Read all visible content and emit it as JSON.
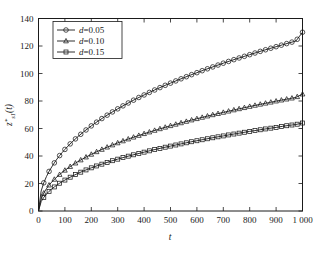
{
  "chart_data": {
    "type": "line",
    "title": "",
    "subtitle": "",
    "xlabel": "t",
    "ylabel": "z*s1(t)",
    "ylabel_parts": {
      "base": "z",
      "sup": "*",
      "sub": "s1",
      "arg": "(t)"
    },
    "xlim": [
      0,
      1000
    ],
    "ylim": [
      0,
      140
    ],
    "xticks": [
      0,
      100,
      200,
      300,
      400,
      500,
      600,
      700,
      800,
      900,
      1000
    ],
    "xtick_labels": [
      "0",
      "100",
      "200",
      "300",
      "400",
      "500",
      "600",
      "700",
      "800",
      "900",
      "1 000"
    ],
    "yticks": [
      0,
      20,
      40,
      60,
      80,
      100,
      120,
      140
    ],
    "ytick_labels": [
      "0",
      "20",
      "40",
      "60",
      "80",
      "100",
      "120",
      "140"
    ],
    "grid": false,
    "legend_position": "upper left",
    "x": [
      0,
      10,
      20,
      30,
      40,
      50,
      60,
      70,
      80,
      90,
      100,
      125,
      150,
      175,
      200,
      225,
      250,
      275,
      300,
      325,
      350,
      375,
      400,
      425,
      450,
      475,
      500,
      525,
      550,
      575,
      600,
      625,
      650,
      675,
      700,
      725,
      750,
      775,
      800,
      825,
      850,
      875,
      900,
      925,
      950,
      975,
      1000
    ],
    "series": [
      {
        "name": "d=0.05",
        "label_var": "d",
        "label_value": "0.05",
        "marker": "circle",
        "color": "#1a1a1a",
        "values": [
          0,
          14.5,
          20.5,
          25.0,
          28.8,
          32.0,
          35.0,
          37.8,
          40.3,
          42.6,
          44.8,
          49.8,
          54.2,
          58.2,
          61.9,
          65.3,
          68.5,
          71.5,
          74.3,
          77.0,
          79.6,
          82.1,
          84.4,
          86.7,
          88.9,
          91.0,
          93.0,
          95.0,
          96.9,
          98.8,
          100.6,
          102.4,
          104.1,
          105.8,
          107.5,
          109.1,
          110.7,
          112.2,
          113.7,
          115.2,
          116.7,
          118.1,
          119.5,
          120.9,
          122.3,
          123.6,
          130.0
        ]
      },
      {
        "name": "d=0.10",
        "label_var": "d",
        "label_value": "0.10",
        "marker": "triangle",
        "color": "#1a1a1a",
        "values": [
          0,
          9.0,
          13.0,
          16.2,
          18.8,
          21.0,
          23.0,
          24.8,
          26.5,
          28.1,
          29.6,
          33.0,
          36.0,
          38.7,
          41.2,
          43.5,
          45.6,
          47.6,
          49.5,
          51.3,
          53.0,
          54.6,
          56.2,
          57.7,
          59.2,
          60.6,
          62.0,
          63.3,
          64.6,
          65.9,
          67.1,
          68.3,
          69.5,
          70.6,
          71.7,
          72.8,
          73.9,
          74.9,
          76.0,
          77.0,
          78.0,
          78.9,
          79.9,
          80.8,
          81.7,
          82.6,
          85.0
        ]
      },
      {
        "name": "d=0.15",
        "label_var": "d",
        "label_value": "0.15",
        "marker": "square",
        "color": "#1a1a1a",
        "values": [
          0,
          6.8,
          9.9,
          12.3,
          14.3,
          16.0,
          17.5,
          18.9,
          20.2,
          21.4,
          22.5,
          25.1,
          27.4,
          29.5,
          31.4,
          33.1,
          34.7,
          36.3,
          37.7,
          39.1,
          40.4,
          41.6,
          42.8,
          44.0,
          45.1,
          46.2,
          47.2,
          48.2,
          49.2,
          50.2,
          51.1,
          52.0,
          52.9,
          53.8,
          54.6,
          55.5,
          56.3,
          57.1,
          57.9,
          58.6,
          59.4,
          60.1,
          60.8,
          61.6,
          62.3,
          62.9,
          64.0
        ]
      }
    ]
  }
}
